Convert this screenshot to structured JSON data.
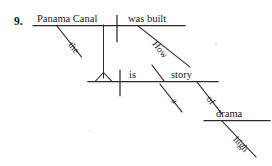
{
  "exercise": {
    "number": "9.",
    "type": "sentence-diagram",
    "sentence": "How high a drama of the Panama Canal was built is story",
    "ink_color": "#2b2b2b",
    "background_color": "#ffffff"
  },
  "diagram": {
    "clauses": [
      {
        "name": "subordinate-clause",
        "subject": "Panama Canal",
        "verb": "was built",
        "modifiers": [
          {
            "word": "the",
            "attaches_to": "Panama Canal"
          },
          {
            "word": "How",
            "attaches_to": "was built"
          }
        ]
      },
      {
        "name": "main-clause",
        "verb": "is",
        "complement": "story",
        "modifiers": [
          {
            "word": "a",
            "attaches_to": "story"
          },
          {
            "word": "of",
            "attaches_to": "story",
            "kind": "preposition"
          },
          {
            "word": "drama",
            "attaches_to": "of",
            "kind": "object-of-preposition"
          },
          {
            "word": "high",
            "attaches_to": "drama"
          }
        ]
      }
    ],
    "words": {
      "panama_canal": "Panama Canal",
      "was_built": "was built",
      "the": "the",
      "how": "How",
      "is": "is",
      "story": "story",
      "a": "a",
      "of": "of",
      "drama": "drama",
      "high": "high"
    }
  }
}
